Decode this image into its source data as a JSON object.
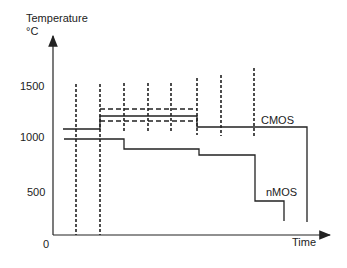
{
  "diagram": {
    "y_axis_label": "Temperature",
    "y_axis_unit": "°C",
    "x_axis_label": "Time",
    "y_ticks": [
      {
        "label": "1500",
        "y": 88
      },
      {
        "label": "1000",
        "y": 137
      },
      {
        "label": "500",
        "y": 193
      },
      {
        "label": "0",
        "y": 244
      }
    ],
    "series_labels": {
      "cmos": "CMOS",
      "nmos": "nMOS"
    },
    "colors": {
      "line": "#222222",
      "background": "#ffffff"
    }
  }
}
